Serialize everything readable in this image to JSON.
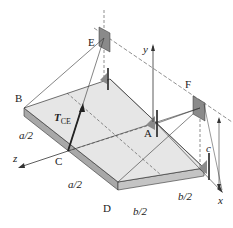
{
  "figure": {
    "points": {
      "B": "B",
      "C": "C",
      "D": "D",
      "A": "A",
      "E": "E",
      "F": "F"
    },
    "axes": {
      "x": "x",
      "y": "y",
      "z": "z"
    },
    "force": {
      "symbol": "T",
      "subscript": "CE"
    },
    "dimensions": {
      "a_half_upper": "a/2",
      "a_half_lower": "a/2",
      "b_half_left": "b/2",
      "b_half_right": "b/2",
      "c": "c"
    },
    "colors": {
      "plate_top": "#e4e4e4",
      "plate_edge": "#a8a8a8",
      "bracket": "#8a8a8a",
      "line": "#333333"
    }
  }
}
